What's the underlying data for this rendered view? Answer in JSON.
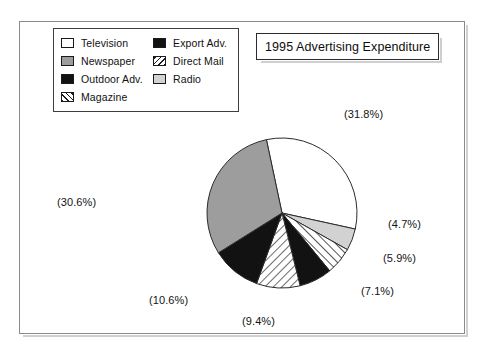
{
  "chart_data": {
    "type": "pie",
    "title": "1995 Advertising Expenditure",
    "unit": "percent",
    "labels": [
      "Television",
      "Radio",
      "Direct Mail",
      "Export Adv.",
      "Magazine",
      "Outdoor Adv.",
      "Newspaper"
    ],
    "values": [
      31.8,
      4.7,
      5.9,
      7.1,
      9.4,
      10.6,
      30.6
    ],
    "value_labels": [
      "(31.8%)",
      "(4.7%)",
      "(5.9%)",
      "(7.1%)",
      "(9.4%)",
      "(10.6%)",
      "(30.6%)"
    ],
    "start_angle_deg": -12,
    "direction": "clockwise",
    "legend_position": "top-left",
    "grid": false,
    "slices": [
      {
        "name": "Television",
        "value": 31.8,
        "label": "(31.8%)",
        "fill": "white",
        "color": "#ffffff"
      },
      {
        "name": "Radio",
        "value": 4.7,
        "label": "(4.7%)",
        "fill": "lightgray",
        "color": "#d2d2d2"
      },
      {
        "name": "Direct Mail",
        "value": 5.9,
        "label": "(5.9%)",
        "fill": "hatch-right",
        "color": "#ffffff"
      },
      {
        "name": "Export Adv.",
        "value": 7.1,
        "label": "(7.1%)",
        "fill": "black",
        "color": "#121212"
      },
      {
        "name": "Magazine",
        "value": 9.4,
        "label": "(9.4%)",
        "fill": "hatch-left",
        "color": "#ffffff"
      },
      {
        "name": "Outdoor Adv.",
        "value": 10.6,
        "label": "(10.6%)",
        "fill": "black",
        "color": "#121212"
      },
      {
        "name": "Newspaper",
        "value": 30.6,
        "label": "(30.6%)",
        "fill": "gray",
        "color": "#9d9d9d"
      }
    ]
  },
  "title": {
    "text": "1995 Advertising Expenditure"
  },
  "legend": {
    "columns": [
      {
        "items": [
          {
            "label": "Television",
            "swatch": "white-swatch-icon"
          },
          {
            "label": "Newspaper",
            "swatch": "gray-swatch-icon"
          },
          {
            "label": "Outdoor Adv.",
            "swatch": "black-swatch-icon"
          },
          {
            "label": "Magazine",
            "swatch": "hatch-left-swatch-icon"
          }
        ]
      },
      {
        "items": [
          {
            "label": "Export Adv.",
            "swatch": "black-swatch-icon"
          },
          {
            "label": "Direct Mail",
            "swatch": "hatch-right-swatch-icon"
          },
          {
            "label": "Radio",
            "swatch": "lightgray-swatch-icon"
          }
        ]
      }
    ]
  },
  "percent_labels": {
    "television": "(31.8%)",
    "radio": "(4.7%)",
    "direct_mail": "(5.9%)",
    "export_adv": "(7.1%)",
    "magazine": "(9.4%)",
    "outdoor_adv": "(10.6%)",
    "newspaper": "(30.6%)"
  },
  "colors": {
    "white": "#ffffff",
    "light_gray": "#d2d2d2",
    "medium_gray": "#9d9d9d",
    "black": "#121212",
    "outline": "#2b2b2b",
    "frame": "#8a8a8a"
  }
}
